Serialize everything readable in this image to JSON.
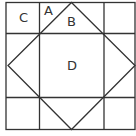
{
  "diagram": {
    "labels": {
      "a": "A",
      "b": "B",
      "c": "C",
      "d": "D"
    },
    "colors": {
      "stroke": "#333333",
      "background": "#ffffff"
    }
  }
}
